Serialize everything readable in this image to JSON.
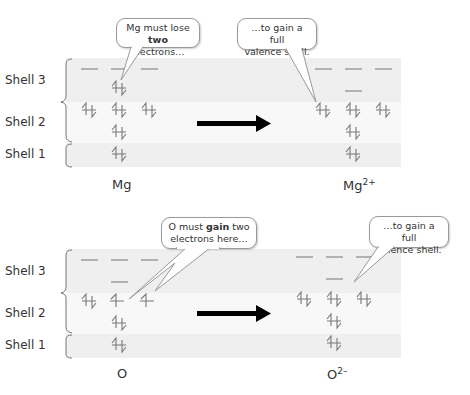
{
  "diagrams": [
    {
      "id": "magnesium",
      "shell_labels": [
        "Shell 3",
        "Shell 2",
        "Shell 1"
      ],
      "before": {
        "symbol": "Mg",
        "charge": ""
      },
      "after": {
        "symbol": "Mg",
        "charge": "2+"
      },
      "before_orbitals": {
        "shell3_p": [
          "empty",
          "empty",
          "empty"
        ],
        "shell3_s": "paired",
        "shell2_p": [
          "paired",
          "paired",
          "paired"
        ],
        "shell2_s": "paired",
        "shell1_s": "paired"
      },
      "after_orbitals": {
        "shell3_p": [
          "empty",
          "empty",
          "empty"
        ],
        "shell3_s": "empty",
        "shell2_p": [
          "paired",
          "paired",
          "paired"
        ],
        "shell2_s": "paired",
        "shell1_s": "paired"
      },
      "bubble_left": {
        "pre": "Mg must lose",
        "bold": "two",
        "post": "electrons…"
      },
      "bubble_right": {
        "line1": "…to gain a full",
        "line2": "valence shell."
      }
    },
    {
      "id": "oxygen",
      "shell_labels": [
        "Shell 3",
        "Shell 2",
        "Shell 1"
      ],
      "before": {
        "symbol": "O",
        "charge": ""
      },
      "after": {
        "symbol": "O",
        "charge": "2–"
      },
      "before_orbitals": {
        "shell3_p": [
          "empty",
          "empty",
          "empty"
        ],
        "shell3_s": "empty",
        "shell2_p": [
          "paired",
          "single",
          "single"
        ],
        "shell2_s": "paired",
        "shell1_s": "paired"
      },
      "after_orbitals": {
        "shell3_p": [
          "empty",
          "empty",
          "empty"
        ],
        "shell3_s": "empty",
        "shell2_p": [
          "paired",
          "paired",
          "paired"
        ],
        "shell2_s": "paired",
        "shell1_s": "paired"
      },
      "bubble_left": {
        "pre": "O must",
        "bold": "gain",
        "post": "two",
        "line2": "electrons here…"
      },
      "bubble_right": {
        "line1": "…to gain a full",
        "line2": "valence shell."
      }
    }
  ],
  "colors": {
    "band_dark": "#efefef",
    "band_light": "#f8f8f8",
    "electron": "#666666",
    "arrow": "#000000"
  }
}
